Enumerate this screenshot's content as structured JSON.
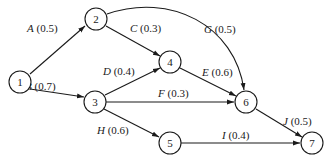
{
  "diagram": {
    "type": "activity-network",
    "nodes": [
      {
        "id": "1",
        "label": "1",
        "x": 20,
        "y": 82
      },
      {
        "id": "2",
        "label": "2",
        "x": 96,
        "y": 19
      },
      {
        "id": "3",
        "label": "3",
        "x": 95,
        "y": 102
      },
      {
        "id": "4",
        "label": "4",
        "x": 170,
        "y": 62
      },
      {
        "id": "5",
        "label": "5",
        "x": 170,
        "y": 143
      },
      {
        "id": "6",
        "label": "6",
        "x": 246,
        "y": 102
      },
      {
        "id": "7",
        "label": "7",
        "x": 312,
        "y": 143
      }
    ],
    "edges": [
      {
        "name": "A",
        "value": "(0.5)",
        "from": "1",
        "to": "2"
      },
      {
        "name": "B",
        "value": "(0.7)",
        "from": "1",
        "to": "3"
      },
      {
        "name": "C",
        "value": "(0.3)",
        "from": "2",
        "to": "4"
      },
      {
        "name": "D",
        "value": "(0.4)",
        "from": "3",
        "to": "4"
      },
      {
        "name": "E",
        "value": "(0.6)",
        "from": "4",
        "to": "6"
      },
      {
        "name": "F",
        "value": "(0.3)",
        "from": "3",
        "to": "6"
      },
      {
        "name": "G",
        "value": "(0.5)",
        "from": "2",
        "to": "6"
      },
      {
        "name": "H",
        "value": "(0.6)",
        "from": "3",
        "to": "5"
      },
      {
        "name": "I",
        "value": "(0.4)",
        "from": "5",
        "to": "7"
      },
      {
        "name": "J",
        "value": "(0.5)",
        "from": "6",
        "to": "7"
      }
    ]
  }
}
